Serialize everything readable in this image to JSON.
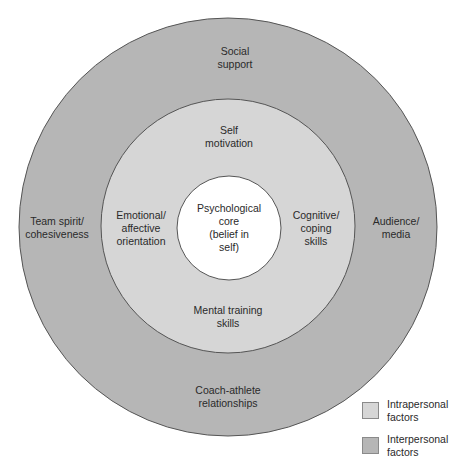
{
  "diagram": {
    "type": "concentric-circles",
    "colors": {
      "outer_ring": "#b6b6b6",
      "middle_ring": "#d6d6d6",
      "core": "#ffffff",
      "stroke": "#555555"
    },
    "core": {
      "label": "Psychological\ncore\n(belief  in\nself)"
    },
    "middle_ring": {
      "category": "intrapersonal",
      "labels": {
        "top": "Self\nmotivation",
        "left": "Emotional/\naffective\norientation",
        "right": "Cognitive/\ncoping\nskills",
        "bottom": "Mental training\nskills"
      }
    },
    "outer_ring": {
      "category": "interpersonal",
      "labels": {
        "top": "Social\nsupport",
        "left": "Team spirit/\ncohesiveness",
        "right": "Audience/\nmedia",
        "bottom": "Coach-athlete\nrelationships"
      }
    }
  },
  "legend": {
    "items": [
      {
        "label": "Intrapersonal\nfactors",
        "color": "#d6d6d6"
      },
      {
        "label": "Interpersonal\nfactors",
        "color": "#b6b6b6"
      }
    ]
  }
}
